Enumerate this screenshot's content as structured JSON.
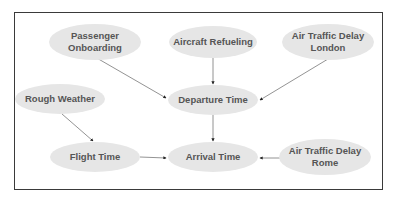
{
  "diagram": {
    "colors": {
      "node_fill": "#e6e6e6",
      "node_text": "#555555",
      "edge": "#777777",
      "frame": "#3a3a3a"
    },
    "nodes": [
      {
        "id": "passenger",
        "label": "Passenger Onboarding",
        "lines": [
          "Passenger",
          "Onboarding"
        ],
        "cx": 95,
        "cy": 42,
        "w": 92,
        "h": 36
      },
      {
        "id": "refuel",
        "label": "Aircraft Refueling",
        "lines": [
          "Aircraft Refueling"
        ],
        "cx": 213,
        "cy": 42,
        "w": 88,
        "h": 32
      },
      {
        "id": "atd_london",
        "label": "Air Traffic Delay London",
        "lines": [
          "Air Traffic Delay",
          "London"
        ],
        "cx": 328,
        "cy": 42,
        "w": 92,
        "h": 36
      },
      {
        "id": "weather",
        "label": "Rough Weather",
        "lines": [
          "Rough Weather"
        ],
        "cx": 60,
        "cy": 99,
        "w": 90,
        "h": 30
      },
      {
        "id": "departure",
        "label": "Departure Time",
        "lines": [
          "Departure Time"
        ],
        "cx": 213,
        "cy": 100,
        "w": 90,
        "h": 30
      },
      {
        "id": "flight",
        "label": "Flight Time",
        "lines": [
          "Flight Time"
        ],
        "cx": 95,
        "cy": 157,
        "w": 90,
        "h": 30
      },
      {
        "id": "arrival",
        "label": "Arrival Time",
        "lines": [
          "Arrival Time"
        ],
        "cx": 213,
        "cy": 157,
        "w": 90,
        "h": 30
      },
      {
        "id": "atd_rome",
        "label": "Air Traffic Delay Rome",
        "lines": [
          "Air Traffic Delay",
          "Rome"
        ],
        "cx": 325,
        "cy": 157,
        "w": 92,
        "h": 36
      }
    ],
    "edges": [
      {
        "from": "passenger",
        "to": "departure",
        "x1": 95,
        "y1": 57,
        "x2": 166,
        "y2": 98
      },
      {
        "from": "refuel",
        "to": "departure",
        "x1": 213,
        "y1": 58,
        "x2": 213,
        "y2": 84
      },
      {
        "from": "atd_london",
        "to": "departure",
        "x1": 328,
        "y1": 59,
        "x2": 260,
        "y2": 100
      },
      {
        "from": "weather",
        "to": "flight",
        "x1": 62,
        "y1": 114,
        "x2": 93,
        "y2": 141
      },
      {
        "from": "departure",
        "to": "arrival",
        "x1": 213,
        "y1": 115,
        "x2": 213,
        "y2": 141
      },
      {
        "from": "flight",
        "to": "arrival",
        "x1": 140,
        "y1": 157,
        "x2": 166,
        "y2": 158
      },
      {
        "from": "atd_rome",
        "to": "arrival",
        "x1": 281,
        "y1": 158,
        "x2": 260,
        "y2": 158
      }
    ]
  }
}
